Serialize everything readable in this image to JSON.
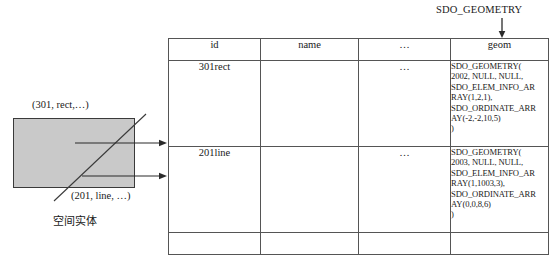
{
  "annotation": {
    "pointer_label": "SDO_GEOMETRY",
    "pointer_icon": "down-arrow-icon"
  },
  "diagram": {
    "rect_label": "(301, rect,…)",
    "line_label": "(201, line, …)",
    "caption": "空间实体",
    "shape_fill": "#c9c9c9",
    "shape_stroke": "#3a3a3a",
    "connector_icon": "right-arrow-icon"
  },
  "table": {
    "columns": [
      {
        "key": "id",
        "label": "id"
      },
      {
        "key": "name",
        "label": "name"
      },
      {
        "key": "dots",
        "label": "…"
      },
      {
        "key": "geom",
        "label": "geom"
      }
    ],
    "rows": [
      {
        "id": "301rect",
        "name": "",
        "dots": "…",
        "geom": "SDO_GEOMETRY(\n2002, NULL, NULL,\nSDO_ELEM_INFO_AR\nRAY(1,2,1),\nSDO_ORDINATE_ARR\nAY(-2,-2,10,5)\n)"
      },
      {
        "id": "201line",
        "name": "",
        "dots": "…",
        "geom": "SDO_GEOMETRY(\n2003, NULL, NULL,\nSDO_ELEM_INFO_AR\nRAY(1,1003,3),\nSDO_ORDINATE_ARR\nAY(0,0,8,6)\n)"
      },
      {
        "id": "",
        "name": "",
        "dots": "",
        "geom": ""
      }
    ]
  }
}
